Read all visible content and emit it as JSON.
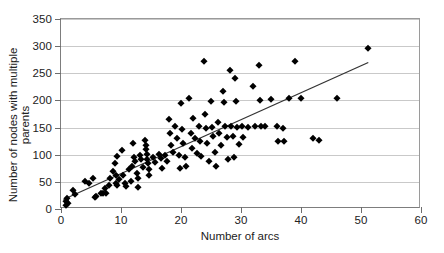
{
  "chart_data": {
    "type": "scatter",
    "title": "",
    "xlabel": "Number of arcs",
    "ylabel": "Number of nodes with multiple parents",
    "xlim": [
      0,
      60
    ],
    "ylim": [
      0,
      350
    ],
    "xticks": [
      0,
      10,
      20,
      30,
      40,
      50,
      60
    ],
    "yticks": [
      0,
      50,
      100,
      150,
      200,
      250,
      300,
      350
    ],
    "grid": "horizontal",
    "legend": "none",
    "marker": "diamond",
    "marker_color": "#000000",
    "trendline": {
      "type": "linear",
      "color": "#333333",
      "x_start": 0.4,
      "y_start": 14,
      "x_end": 51.5,
      "y_end": 269
    },
    "points": [
      [
        0.8,
        8
      ],
      [
        0.9,
        14
      ],
      [
        1.0,
        20
      ],
      [
        1.1,
        11
      ],
      [
        2.0,
        35
      ],
      [
        2.4,
        27
      ],
      [
        4.0,
        52
      ],
      [
        4.6,
        47
      ],
      [
        5.4,
        58
      ],
      [
        5.6,
        22
      ],
      [
        5.8,
        24
      ],
      [
        6.6,
        30
      ],
      [
        7.0,
        29
      ],
      [
        7.4,
        38
      ],
      [
        7.5,
        30
      ],
      [
        8.0,
        44
      ],
      [
        8.2,
        58
      ],
      [
        8.6,
        70
      ],
      [
        9.0,
        85
      ],
      [
        9.1,
        48
      ],
      [
        9.2,
        63
      ],
      [
        9.3,
        44
      ],
      [
        9.4,
        97
      ],
      [
        9.6,
        55
      ],
      [
        10.2,
        109
      ],
      [
        10.4,
        63
      ],
      [
        10.6,
        47
      ],
      [
        10.8,
        42
      ],
      [
        11.4,
        73
      ],
      [
        11.6,
        52
      ],
      [
        11.8,
        79
      ],
      [
        12.0,
        122
      ],
      [
        12.2,
        96
      ],
      [
        12.4,
        88
      ],
      [
        12.6,
        67
      ],
      [
        12.8,
        57
      ],
      [
        12.9,
        40
      ],
      [
        13.2,
        100
      ],
      [
        13.4,
        92
      ],
      [
        13.6,
        78
      ],
      [
        14.0,
        128
      ],
      [
        14.1,
        118
      ],
      [
        14.2,
        110
      ],
      [
        14.3,
        101
      ],
      [
        14.4,
        92
      ],
      [
        14.5,
        84
      ],
      [
        14.6,
        74
      ],
      [
        14.7,
        62
      ],
      [
        15.4,
        96
      ],
      [
        15.6,
        87
      ],
      [
        16.4,
        102
      ],
      [
        16.6,
        94
      ],
      [
        16.8,
        75
      ],
      [
        17.4,
        99
      ],
      [
        17.6,
        88
      ],
      [
        18.0,
        165
      ],
      [
        18.2,
        140
      ],
      [
        18.4,
        118
      ],
      [
        18.6,
        105
      ],
      [
        19.0,
        152
      ],
      [
        19.4,
        130
      ],
      [
        19.6,
        100
      ],
      [
        19.8,
        76
      ],
      [
        20.0,
        195
      ],
      [
        20.2,
        148
      ],
      [
        20.4,
        122
      ],
      [
        20.6,
        96
      ],
      [
        20.8,
        79
      ],
      [
        21.4,
        205
      ],
      [
        21.6,
        140
      ],
      [
        21.8,
        113
      ],
      [
        22.0,
        168
      ],
      [
        22.4,
        131
      ],
      [
        22.6,
        104
      ],
      [
        23.0,
        152
      ],
      [
        23.2,
        126
      ],
      [
        23.4,
        98
      ],
      [
        23.8,
        272
      ],
      [
        24.0,
        175
      ],
      [
        24.2,
        150
      ],
      [
        24.4,
        122
      ],
      [
        24.6,
        88
      ],
      [
        25.0,
        199
      ],
      [
        25.2,
        151
      ],
      [
        25.4,
        134
      ],
      [
        25.6,
        105
      ],
      [
        25.8,
        80
      ],
      [
        26.2,
        160
      ],
      [
        26.4,
        140
      ],
      [
        26.6,
        117
      ],
      [
        27.0,
        217
      ],
      [
        27.2,
        198
      ],
      [
        27.4,
        152
      ],
      [
        27.6,
        133
      ],
      [
        27.8,
        93
      ],
      [
        28.2,
        256
      ],
      [
        28.4,
        152
      ],
      [
        28.6,
        135
      ],
      [
        28.8,
        96
      ],
      [
        29.0,
        242
      ],
      [
        29.2,
        199
      ],
      [
        29.4,
        151
      ],
      [
        29.6,
        119
      ],
      [
        30.2,
        153
      ],
      [
        30.4,
        132
      ],
      [
        31.2,
        151
      ],
      [
        32.0,
        226
      ],
      [
        32.4,
        152
      ],
      [
        33.0,
        265
      ],
      [
        33.2,
        200
      ],
      [
        33.4,
        153
      ],
      [
        34.0,
        152
      ],
      [
        35.0,
        203
      ],
      [
        36.0,
        152
      ],
      [
        36.2,
        126
      ],
      [
        37.0,
        149
      ],
      [
        37.2,
        125
      ],
      [
        38.0,
        205
      ],
      [
        39.0,
        272
      ],
      [
        40.0,
        204
      ],
      [
        42.0,
        130
      ],
      [
        43.0,
        128
      ],
      [
        46.0,
        205
      ],
      [
        51.2,
        296
      ]
    ]
  }
}
